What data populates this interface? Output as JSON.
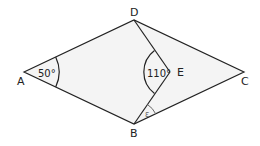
{
  "diagram": {
    "points": {
      "A": {
        "label": "A",
        "x": 24,
        "y": 72
      },
      "B": {
        "label": "B",
        "x": 134,
        "y": 124
      },
      "C": {
        "label": "C",
        "x": 244,
        "y": 72
      },
      "D": {
        "label": "D",
        "x": 134,
        "y": 20
      },
      "E": {
        "label": "E",
        "x": 170,
        "y": 72
      }
    },
    "angles": {
      "A": {
        "label": "50°"
      },
      "E": {
        "label": "110°"
      },
      "B": {
        "label": "ε"
      }
    },
    "colors": {
      "fill": "#f4f4f4",
      "stroke": "#222222",
      "angle_mark_epsilon": "#666666"
    }
  }
}
